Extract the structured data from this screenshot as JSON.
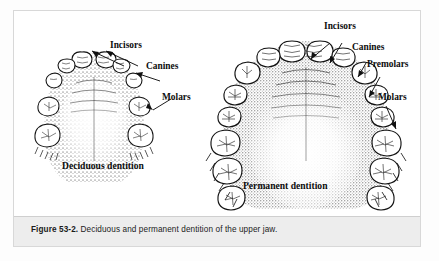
{
  "figure": {
    "caption_number": "Figure 53-2.",
    "caption_text": "Deciduous and permanent dentition of the upper jaw.",
    "border_color": "#d8d8d8",
    "caption_band_color": "#ededed",
    "ink_color": "#111111",
    "page_background": "#fdfdfd"
  },
  "deciduous": {
    "title": "Deciduous dentition",
    "labels": {
      "incisors": "Incisors",
      "canines": "Canines",
      "molars": "Molars"
    },
    "tooth_count": 10
  },
  "permanent": {
    "title": "Permanent dentition",
    "labels": {
      "incisors": "Incisors",
      "canines": "Canines",
      "premolars": "Premolars",
      "molars": "Molars"
    },
    "tooth_count": 16
  }
}
